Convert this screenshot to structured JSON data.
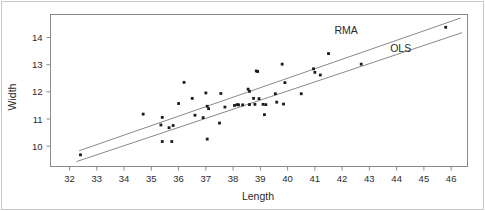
{
  "chart_data": {
    "type": "scatter",
    "title": "",
    "xlabel": "Length",
    "ylabel": "Width",
    "xlim": [
      31.3,
      46.6
    ],
    "ylim": [
      9.25,
      14.85
    ],
    "grid": false,
    "xticks": [
      32,
      33,
      34,
      35,
      36,
      37,
      38,
      39,
      40,
      41,
      42,
      43,
      44,
      45,
      46
    ],
    "yticks": [
      10,
      11,
      12,
      13,
      14
    ],
    "xtick_labels": [
      "32",
      "33",
      "34",
      "35",
      "36",
      "37",
      "38",
      "39",
      "40",
      "41",
      "42",
      "43",
      "44",
      "45",
      "46"
    ],
    "ytick_labels": [
      "10",
      "11",
      "12",
      "13",
      "14"
    ],
    "legend_position": "inside-upper-right",
    "points": [
      [
        32.4,
        9.68
      ],
      [
        34.7,
        11.18
      ],
      [
        35.35,
        10.78
      ],
      [
        35.4,
        11.06
      ],
      [
        35.4,
        10.17
      ],
      [
        35.65,
        10.68
      ],
      [
        35.75,
        10.17
      ],
      [
        35.8,
        10.76
      ],
      [
        36.0,
        11.57
      ],
      [
        36.2,
        12.35
      ],
      [
        36.5,
        11.76
      ],
      [
        36.6,
        11.14
      ],
      [
        36.9,
        11.05
      ],
      [
        37.0,
        11.96
      ],
      [
        37.05,
        11.47
      ],
      [
        37.1,
        11.38
      ],
      [
        37.05,
        10.26
      ],
      [
        37.5,
        10.85
      ],
      [
        37.55,
        11.94
      ],
      [
        37.7,
        11.44
      ],
      [
        38.05,
        11.5
      ],
      [
        38.15,
        11.53
      ],
      [
        38.2,
        11.52
      ],
      [
        38.35,
        11.52
      ],
      [
        38.55,
        12.1
      ],
      [
        38.6,
        12.02
      ],
      [
        38.6,
        11.53
      ],
      [
        38.75,
        11.76
      ],
      [
        38.8,
        11.54
      ],
      [
        38.85,
        12.77
      ],
      [
        38.9,
        12.75
      ],
      [
        38.95,
        11.75
      ],
      [
        39.1,
        11.54
      ],
      [
        39.2,
        11.53
      ],
      [
        39.15,
        11.16
      ],
      [
        39.55,
        11.93
      ],
      [
        39.6,
        11.62
      ],
      [
        39.8,
        13.02
      ],
      [
        39.85,
        11.55
      ],
      [
        39.9,
        12.34
      ],
      [
        40.5,
        11.93
      ],
      [
        40.95,
        12.85
      ],
      [
        41.0,
        12.72
      ],
      [
        41.2,
        12.62
      ],
      [
        41.5,
        13.41
      ],
      [
        42.7,
        13.02
      ],
      [
        45.8,
        14.38
      ]
    ],
    "fit_lines": [
      {
        "name": "RMA",
        "label": "RMA",
        "x_start": 32.35,
        "y_start": 9.83,
        "x_end": 46.35,
        "y_end": 14.72,
        "label_x": 42.15,
        "label_y": 14.14
      },
      {
        "name": "OLS",
        "label": "OLS",
        "x_start": 32.25,
        "y_start": 9.43,
        "x_end": 46.4,
        "y_end": 14.18,
        "label_x": 44.15,
        "label_y": 13.46
      }
    ]
  }
}
